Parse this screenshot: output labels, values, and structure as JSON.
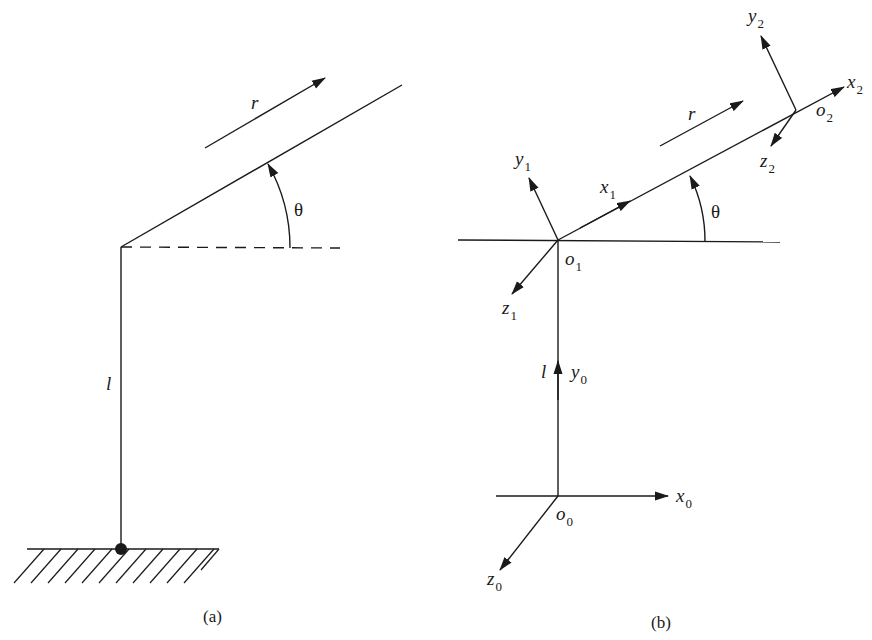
{
  "panel_a": {
    "caption": "(a)",
    "labels": {
      "r": "r",
      "theta": "θ",
      "l": "l"
    }
  },
  "panel_b": {
    "caption": "(b)",
    "labels": {
      "r": "r",
      "theta": "θ",
      "l": "l",
      "x0": "x",
      "x0_sub": "0",
      "y0": "y",
      "y0_sub": "0",
      "z0": "z",
      "z0_sub": "0",
      "o0": "o",
      "o0_sub": "0",
      "x1": "x",
      "x1_sub": "1",
      "y1": "y",
      "y1_sub": "1",
      "z1": "z",
      "z1_sub": "1",
      "o1": "o",
      "o1_sub": "1",
      "x2": "x",
      "x2_sub": "2",
      "y2": "y",
      "y2_sub": "2",
      "z2": "z",
      "z2_sub": "2",
      "o2": "o",
      "o2_sub": "2"
    }
  },
  "colors": {
    "ink": "#1a1a1a",
    "background": "#ffffff"
  }
}
